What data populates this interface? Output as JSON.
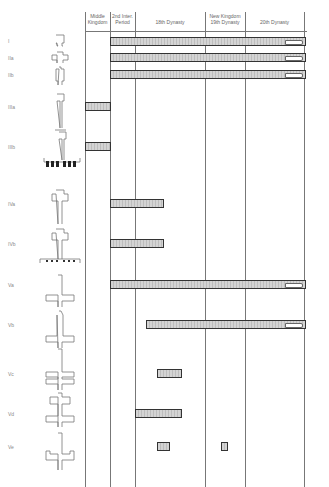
{
  "header": {
    "columns": [
      {
        "label": "Middle Kingdom",
        "x": 85,
        "w": 25
      },
      {
        "label": "2nd Inter. Period",
        "x": 110,
        "w": 25
      },
      {
        "label": "18th Dynasty",
        "x": 135,
        "w": 70
      },
      {
        "label": "19th Dynasty",
        "x": 205,
        "w": 40
      },
      {
        "label": "20th Dynasty",
        "x": 245,
        "w": 59
      }
    ],
    "group_label": "New Kingdom"
  },
  "grid_lines_x": [
    85,
    110,
    135,
    205,
    245,
    304
  ],
  "rows": [
    {
      "label": "I",
      "y": 41,
      "bar": {
        "x1": 110,
        "x2": 306,
        "arrow": true
      }
    },
    {
      "label": "IIa",
      "y": 57,
      "bar": {
        "x1": 110,
        "x2": 306,
        "arrow": true
      }
    },
    {
      "label": "IIb",
      "y": 74,
      "bar": {
        "x1": 110,
        "x2": 306,
        "arrow": true
      }
    },
    {
      "label": "IIIa",
      "y": 106,
      "bar": {
        "x1": 85,
        "x2": 110,
        "arrow": false
      }
    },
    {
      "label": "IIIb",
      "y": 146,
      "bar": {
        "x1": 85,
        "x2": 110,
        "arrow": false
      }
    },
    {
      "label": "IVa",
      "y": 203,
      "bar": {
        "x1": 110,
        "x2": 164,
        "arrow": false
      }
    },
    {
      "label": "IVb",
      "y": 243,
      "bar": {
        "x1": 110,
        "x2": 164,
        "arrow": false
      }
    },
    {
      "label": "Va",
      "y": 284,
      "bar": {
        "x1": 110,
        "x2": 306,
        "arrow": true
      }
    },
    {
      "label": "Vb",
      "y": 324,
      "bar": {
        "x1": 146,
        "x2": 306,
        "arrow": true
      }
    },
    {
      "label": "Vc",
      "y": 373,
      "bar": {
        "x1": 157,
        "x2": 182,
        "arrow": false
      }
    },
    {
      "label": "Vd",
      "y": 413,
      "bar": {
        "x1": 135,
        "x2": 182,
        "arrow": false
      }
    },
    {
      "label": "Ve",
      "y": 446,
      "bars": [
        {
          "x1": 157,
          "x2": 170
        },
        {
          "x1": 221,
          "x2": 228
        }
      ]
    }
  ]
}
